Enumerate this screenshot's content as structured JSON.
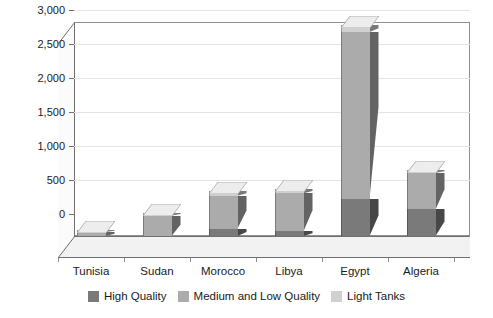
{
  "chart_data": {
    "type": "bar",
    "subtype": "stacked-3d-column",
    "title": "",
    "xlabel": "",
    "ylabel": "",
    "categories": [
      "Tunisia",
      "Sudan",
      "Morocco",
      "Libya",
      "Egypt",
      "Algeria"
    ],
    "series": [
      {
        "name": "High Quality",
        "color": "#7a7a7a",
        "values": [
          0,
          0,
          110,
          70,
          550,
          390
        ]
      },
      {
        "name": "Medium and Low Quality",
        "color": "#ababab",
        "values": [
          60,
          300,
          480,
          560,
          2450,
          540
        ]
      },
      {
        "name": "Light Tanks",
        "color": "#d0d0d0",
        "values": [
          30,
          40,
          70,
          60,
          100,
          40
        ]
      }
    ],
    "totals": [
      90,
      340,
      660,
      690,
      3100,
      970
    ],
    "ytick_labels": [
      "0",
      "500",
      "1,000",
      "1,500",
      "2,000",
      "2,500",
      "3,000"
    ],
    "ytick_values": [
      0,
      500,
      1000,
      1500,
      2000,
      2500,
      3000
    ],
    "ylim": [
      0,
      3200
    ],
    "grid": true,
    "legend_position": "bottom"
  },
  "legend": {
    "items": [
      {
        "label": "High Quality",
        "color": "#7a7a7a"
      },
      {
        "label": "Medium and Low Quality",
        "color": "#ababab"
      },
      {
        "label": "Light Tanks",
        "color": "#d0d0d0"
      }
    ]
  },
  "colors": {
    "axis": "#6f6f6f",
    "grid": "#e4e4e4",
    "wall": "#ffffff",
    "floor": "#f2f2f2",
    "text": "#1a1a1a"
  }
}
